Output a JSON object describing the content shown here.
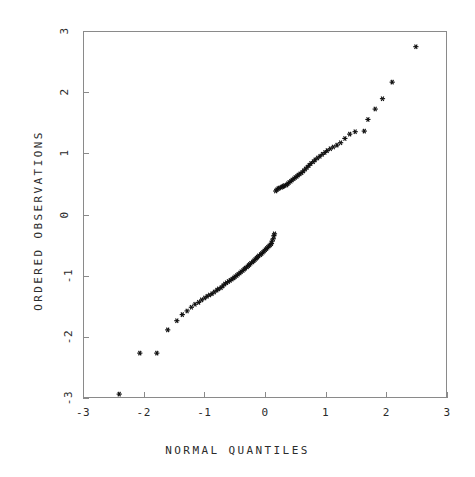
{
  "chart_data": {
    "type": "scatter",
    "title": "",
    "xlabel": "NORMAL QUANTILES",
    "ylabel": "ORDERED OBSERVATIONS",
    "xlim": [
      -3,
      3
    ],
    "ylim": [
      -3,
      3
    ],
    "xticks": [
      -3,
      -2,
      -1,
      0,
      1,
      2,
      3
    ],
    "yticks": [
      -3,
      -2,
      -1,
      0,
      1,
      2,
      3
    ],
    "xticklabels": [
      "-3",
      "-2",
      "-1",
      "0",
      "1",
      "2",
      "3"
    ],
    "yticklabels": [
      "-3",
      "-2",
      "-1",
      "0",
      "1",
      "2",
      "3"
    ],
    "grid": false,
    "legend": null,
    "marker": "asterisk",
    "marker_color": "#101010",
    "frame_color": "#8a8a8a",
    "background": "#ffffff",
    "series": [
      {
        "name": "ordered observations",
        "points": [
          [
            -2.42,
            -2.92
          ],
          [
            -2.08,
            -2.25
          ],
          [
            -1.8,
            -2.25
          ],
          [
            -1.62,
            -1.87
          ],
          [
            -1.47,
            -1.72
          ],
          [
            -1.38,
            -1.62
          ],
          [
            -1.3,
            -1.56
          ],
          [
            -1.23,
            -1.5
          ],
          [
            -1.17,
            -1.45
          ],
          [
            -1.11,
            -1.42
          ],
          [
            -1.06,
            -1.38
          ],
          [
            -1.01,
            -1.35
          ],
          [
            -0.97,
            -1.32
          ],
          [
            -0.93,
            -1.3
          ],
          [
            -0.89,
            -1.28
          ],
          [
            -0.85,
            -1.25
          ],
          [
            -0.81,
            -1.22
          ],
          [
            -0.78,
            -1.2
          ],
          [
            -0.74,
            -1.18
          ],
          [
            -0.71,
            -1.15
          ],
          [
            -0.68,
            -1.12
          ],
          [
            -0.65,
            -1.1
          ],
          [
            -0.62,
            -1.08
          ],
          [
            -0.59,
            -1.06
          ],
          [
            -0.56,
            -1.04
          ],
          [
            -0.53,
            -1.02
          ],
          [
            -0.51,
            -1.0
          ],
          [
            -0.48,
            -0.98
          ],
          [
            -0.46,
            -0.96
          ],
          [
            -0.43,
            -0.94
          ],
          [
            -0.41,
            -0.92
          ],
          [
            -0.38,
            -0.9
          ],
          [
            -0.36,
            -0.88
          ],
          [
            -0.34,
            -0.86
          ],
          [
            -0.31,
            -0.84
          ],
          [
            -0.29,
            -0.82
          ],
          [
            -0.27,
            -0.8
          ],
          [
            -0.25,
            -0.78
          ],
          [
            -0.22,
            -0.76
          ],
          [
            -0.2,
            -0.74
          ],
          [
            -0.18,
            -0.72
          ],
          [
            -0.16,
            -0.7
          ],
          [
            -0.14,
            -0.68
          ],
          [
            -0.12,
            -0.66
          ],
          [
            -0.09,
            -0.64
          ],
          [
            -0.07,
            -0.62
          ],
          [
            -0.05,
            -0.6
          ],
          [
            -0.03,
            -0.58
          ],
          [
            -0.01,
            -0.56
          ],
          [
            0.01,
            -0.54
          ],
          [
            0.03,
            -0.52
          ],
          [
            0.05,
            -0.5
          ],
          [
            0.07,
            -0.48
          ],
          [
            0.09,
            -0.46
          ],
          [
            0.1,
            -0.42
          ],
          [
            0.12,
            -0.38
          ],
          [
            0.13,
            -0.33
          ],
          [
            0.14,
            -0.3
          ],
          [
            0.16,
            0.4
          ],
          [
            0.18,
            0.42
          ],
          [
            0.2,
            0.44
          ],
          [
            0.22,
            0.45
          ],
          [
            0.25,
            0.46
          ],
          [
            0.27,
            0.47
          ],
          [
            0.29,
            0.48
          ],
          [
            0.31,
            0.49
          ],
          [
            0.34,
            0.5
          ],
          [
            0.36,
            0.52
          ],
          [
            0.38,
            0.54
          ],
          [
            0.41,
            0.56
          ],
          [
            0.43,
            0.58
          ],
          [
            0.46,
            0.6
          ],
          [
            0.48,
            0.62
          ],
          [
            0.51,
            0.64
          ],
          [
            0.53,
            0.66
          ],
          [
            0.56,
            0.68
          ],
          [
            0.59,
            0.7
          ],
          [
            0.62,
            0.73
          ],
          [
            0.65,
            0.76
          ],
          [
            0.68,
            0.79
          ],
          [
            0.71,
            0.82
          ],
          [
            0.74,
            0.85
          ],
          [
            0.78,
            0.88
          ],
          [
            0.81,
            0.91
          ],
          [
            0.85,
            0.94
          ],
          [
            0.89,
            0.97
          ],
          [
            0.93,
            1.0
          ],
          [
            0.97,
            1.03
          ],
          [
            1.01,
            1.06
          ],
          [
            1.06,
            1.09
          ],
          [
            1.11,
            1.12
          ],
          [
            1.17,
            1.15
          ],
          [
            1.23,
            1.19
          ],
          [
            1.3,
            1.26
          ],
          [
            1.38,
            1.33
          ],
          [
            1.47,
            1.37
          ],
          [
            1.62,
            1.38
          ],
          [
            1.68,
            1.57
          ],
          [
            1.8,
            1.74
          ],
          [
            1.92,
            1.91
          ],
          [
            2.08,
            2.18
          ],
          [
            2.47,
            2.76
          ]
        ]
      }
    ]
  }
}
